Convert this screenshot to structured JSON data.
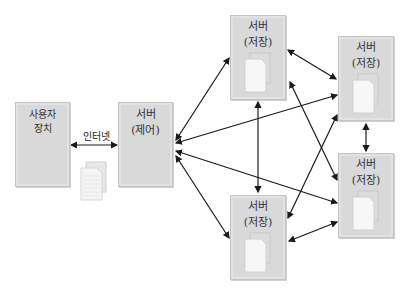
{
  "diagram": {
    "nodes": [
      {
        "id": "user",
        "line1": "사용자",
        "line2": "장치",
        "doc": false
      },
      {
        "id": "control",
        "line1": "서버",
        "line2": "(제어)",
        "doc": false
      },
      {
        "id": "storage_top",
        "line1": "서버",
        "line2": "(저장)",
        "doc": true
      },
      {
        "id": "storage_right_top",
        "line1": "서버",
        "line2": "(저장)",
        "doc": true
      },
      {
        "id": "storage_right_bottom",
        "line1": "서버",
        "line2": "(저장)",
        "doc": true
      },
      {
        "id": "storage_bottom",
        "line1": "서버",
        "line2": "(저장)",
        "doc": true
      }
    ],
    "internet_label": "인터넷",
    "edges": [
      [
        "user",
        "control"
      ],
      [
        "control",
        "storage_top"
      ],
      [
        "control",
        "storage_right_top"
      ],
      [
        "control",
        "storage_right_bottom"
      ],
      [
        "control",
        "storage_bottom"
      ],
      [
        "storage_top",
        "storage_right_top"
      ],
      [
        "storage_top",
        "storage_right_bottom"
      ],
      [
        "storage_top",
        "storage_bottom"
      ],
      [
        "storage_right_top",
        "storage_right_bottom"
      ],
      [
        "storage_right_top",
        "storage_bottom"
      ],
      [
        "storage_right_bottom",
        "storage_bottom"
      ]
    ],
    "colors": {
      "box_fill": "#d9d9d9",
      "arrow": "#1a1a1a",
      "doc_fill": "#f7f7f7"
    }
  }
}
